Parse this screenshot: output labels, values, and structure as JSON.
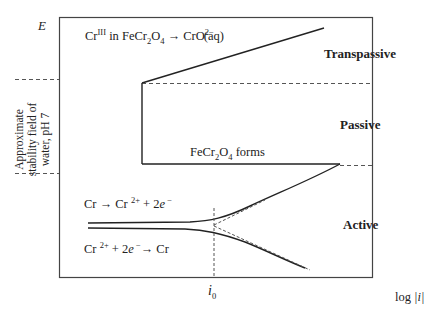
{
  "axes": {
    "y_label": "E",
    "x_label_prefix": "log ",
    "x_label_var": "|i|"
  },
  "regions": {
    "transpassive": "Transpassive",
    "passive": "Passive",
    "active": "Active"
  },
  "annotations": {
    "transpassive_reaction": {
      "part1": "Cr",
      "sup1": "III",
      "part2": " in FeCr",
      "sub1": "2",
      "part3": "O",
      "sub2": "4",
      "part4": " → CrO",
      "sub3": "4",
      "sup2": "2−",
      "part5": "(aq)"
    },
    "film_forms": {
      "part1": "FeCr",
      "sub1": "2",
      "part2": "O",
      "sub2": "4",
      "part3": " forms"
    },
    "anodic_reaction": {
      "part1": "Cr → Cr ",
      "sup1": "2+",
      "part2": " + 2",
      "e": "e",
      "sup2": " −"
    },
    "cathodic_reaction": {
      "part1": "Cr ",
      "sup1": "2+",
      "part2": " + 2",
      "e": "e",
      "sup2": " −",
      "part3": "→ Cr"
    },
    "exchange_current": {
      "symbol": "i",
      "sub": "0"
    },
    "water_stability": {
      "line1": "Approximate",
      "line2": "stability field of",
      "line3": "water, pH 7"
    }
  },
  "colors": {
    "line": "#222222",
    "dashed": "#555555",
    "frame": "#444444"
  }
}
